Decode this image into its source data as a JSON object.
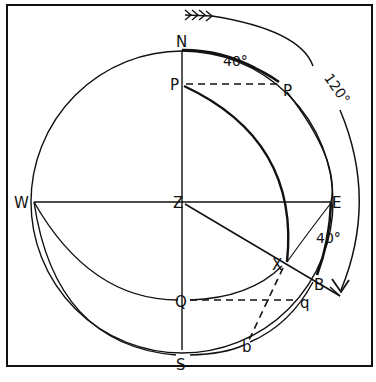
{
  "diagram": {
    "labels": {
      "N": "N",
      "S": "S",
      "E": "E",
      "W": "W",
      "Z": "Z",
      "P": "P",
      "p": "P",
      "Q": "Q",
      "q": "q",
      "X": "X",
      "B": "B",
      "b": "b"
    },
    "angles": {
      "top_arc": "40°",
      "right_arc": "40°",
      "outer_arc": "120°"
    },
    "colors": {
      "ink": "#111111",
      "background": "#ffffff"
    }
  }
}
